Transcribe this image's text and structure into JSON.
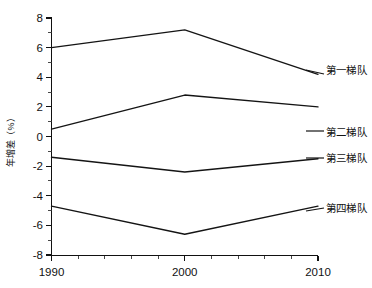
{
  "chart_data": {
    "type": "line",
    "title": "",
    "xlabel": "",
    "ylabel": "年增差（%）",
    "x": [
      1990,
      2000,
      2010
    ],
    "xlim": [
      1990,
      2010
    ],
    "ylim": [
      -8,
      8
    ],
    "yticks": [
      8,
      6,
      4,
      2,
      0,
      -2,
      -4,
      -6,
      -8
    ],
    "xticks": [
      1990,
      2000,
      2010
    ],
    "minor_ticks": true,
    "grid": false,
    "legend_position": "right-inline",
    "series": [
      {
        "name": "第一梯队",
        "values": [
          6.0,
          7.2,
          4.2
        ]
      },
      {
        "name": "第二梯队",
        "values": [
          0.5,
          2.8,
          2.0
        ]
      },
      {
        "name": "第三梯队",
        "values": [
          -1.4,
          -2.4,
          -1.5
        ]
      },
      {
        "name": "第四梯队",
        "values": [
          -4.7,
          -6.6,
          -4.7
        ]
      }
    ]
  },
  "axis": {
    "ytick_labels": [
      "8",
      "6",
      "4",
      "2",
      "0",
      "-2",
      "-4",
      "-6",
      "-8"
    ],
    "xtick_labels": [
      "1990",
      "2000",
      "2010"
    ],
    "y_axis_title": "年增差（%）"
  },
  "legend": {
    "items": [
      {
        "label": "第一梯队"
      },
      {
        "label": "第二梯队"
      },
      {
        "label": "第三梯队"
      },
      {
        "label": "第四梯队"
      }
    ]
  }
}
